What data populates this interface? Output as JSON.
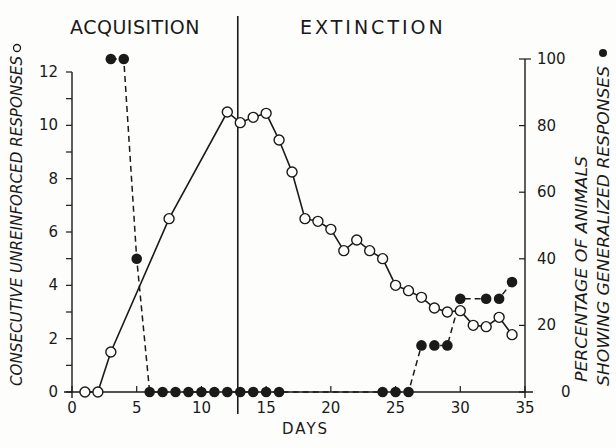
{
  "chart_data": {
    "type": "line",
    "title": "",
    "phase_labels": [
      "ACQUISITION",
      "EXTINCTION"
    ],
    "phase_boundary_day": 12.5,
    "xlabel": "DAYS",
    "ylabel_left": "CONSECUTIVE UNREINFORCED RESPONSES",
    "ylabel_left_marker": "open-circle",
    "ylabel_right_line1": "PERCENTAGE OF ANIMALS",
    "ylabel_right_line2": "SHOWING GENERALIZED RESPONSES",
    "ylabel_right_marker": "filled-circle",
    "xlim": [
      0,
      35
    ],
    "ylim_left": [
      0,
      12
    ],
    "ylim_right": [
      0,
      100
    ],
    "x_ticks": [
      0,
      5,
      10,
      15,
      20,
      25,
      30,
      35
    ],
    "y_left_ticks": [
      0,
      2,
      4,
      6,
      8,
      10,
      12
    ],
    "y_right_ticks": [
      0,
      20,
      40,
      60,
      80,
      100
    ],
    "grid": false,
    "series": [
      {
        "name": "Consecutive unreinforced responses",
        "axis": "left",
        "marker": "open-circle",
        "line": "solid",
        "x": [
          1,
          2,
          3,
          7.5,
          12,
          13,
          14,
          15,
          16,
          17,
          18,
          19,
          20,
          21,
          22,
          23,
          24,
          25,
          26,
          27,
          28,
          29,
          30,
          31,
          32,
          33,
          34
        ],
        "values": [
          0,
          0,
          1.5,
          6.5,
          10.5,
          10.1,
          10.3,
          10.45,
          9.45,
          8.25,
          6.5,
          6.4,
          6.1,
          5.3,
          5.7,
          5.3,
          5.0,
          4.0,
          3.8,
          3.55,
          3.15,
          3.0,
          3.05,
          2.5,
          2.45,
          2.8,
          2.15
        ]
      },
      {
        "name": "Percentage of animals showing generalized responses",
        "axis": "right",
        "marker": "filled-circle",
        "line": "dashed",
        "x": [
          3,
          4,
          5,
          6,
          7,
          8,
          9,
          10,
          11,
          12,
          13,
          14,
          15,
          16,
          24,
          25,
          26,
          27,
          28,
          29,
          30,
          32,
          33,
          34
        ],
        "values": [
          100,
          100,
          40,
          0,
          0,
          0,
          0,
          0,
          0,
          0,
          0,
          0,
          0,
          0,
          0,
          0,
          0,
          14,
          14,
          14,
          28,
          28,
          28,
          33
        ],
        "segments": [
          [
            0,
            15
          ],
          [
            15,
            24
          ]
        ]
      }
    ]
  }
}
